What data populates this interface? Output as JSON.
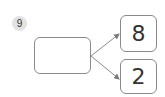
{
  "problem": {
    "number": "9"
  },
  "diagram": {
    "source_box": {
      "value": ""
    },
    "targets": [
      {
        "value": "8"
      },
      {
        "value": "2"
      }
    ],
    "colors": {
      "stroke": "#8a8a8a",
      "badge_bg": "#e2e2e2",
      "text": "#333333"
    }
  }
}
